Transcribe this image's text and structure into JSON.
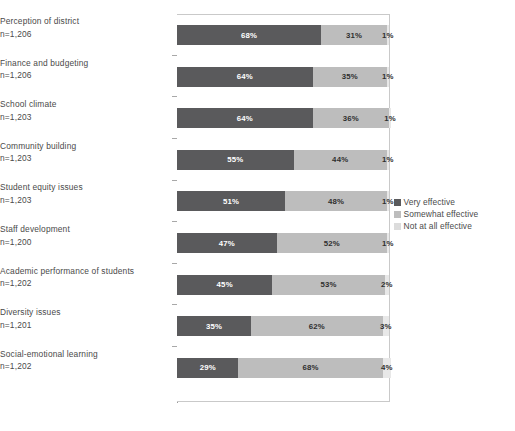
{
  "chart_data": {
    "type": "bar",
    "subtype": "stacked-horizontal-100",
    "title": "",
    "subtitle": "",
    "xlabel": "",
    "ylabel": "",
    "xlim": [
      0,
      100
    ],
    "grid": false,
    "legend_position": "right",
    "categories": [
      "Perception of district",
      "Finance and budgeting",
      "School climate",
      "Community building",
      "Student equity issues",
      "Staff development",
      "Academic performance of students",
      "Diversity issues",
      "Social-emotional learning"
    ],
    "category_sublabels": [
      "n=1,206",
      "n=1,206",
      "n=1,203",
      "n=1,203",
      "n=1,203",
      "n=1,200",
      "n=1,202",
      "n=1,201",
      "n=1,202"
    ],
    "series": [
      {
        "name": "Very effective",
        "color": "#5a5a5c",
        "values": [
          68,
          64,
          64,
          55,
          51,
          47,
          45,
          35,
          29
        ],
        "labels": [
          "68%",
          "64%",
          "64%",
          "55%",
          "51%",
          "47%",
          "45%",
          "35%",
          "29%"
        ]
      },
      {
        "name": "Somewhat effective",
        "color": "#bdbdbd",
        "values": [
          31,
          35,
          36,
          44,
          48,
          52,
          53,
          62,
          68
        ],
        "labels": [
          "31%",
          "35%",
          "36%",
          "44%",
          "48%",
          "52%",
          "53%",
          "62%",
          "68%"
        ]
      },
      {
        "name": "Not at all effective",
        "color": "#e8e8e8",
        "values": [
          1,
          1,
          1,
          1,
          1,
          1,
          2,
          3,
          4
        ],
        "labels": [
          "1%",
          "1%",
          "1%",
          "1%",
          "1%",
          "1%",
          "2%",
          "3%",
          "4%"
        ]
      }
    ]
  },
  "legend": {
    "items": [
      {
        "label": "Very effective"
      },
      {
        "label": "Somewhat effective"
      },
      {
        "label": "Not at all effective"
      }
    ]
  }
}
